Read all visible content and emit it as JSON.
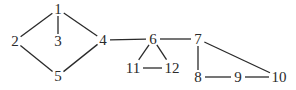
{
  "diagram": {
    "type": "undirected-graph",
    "nodes": [
      {
        "id": "1",
        "label": "1",
        "x": 58,
        "y": 9
      },
      {
        "id": "2",
        "label": "2",
        "x": 15,
        "y": 41
      },
      {
        "id": "3",
        "label": "3",
        "x": 58,
        "y": 41
      },
      {
        "id": "4",
        "label": "4",
        "x": 103,
        "y": 40
      },
      {
        "id": "5",
        "label": "5",
        "x": 58,
        "y": 76
      },
      {
        "id": "6",
        "label": "6",
        "x": 153,
        "y": 39
      },
      {
        "id": "7",
        "label": "7",
        "x": 198,
        "y": 39
      },
      {
        "id": "8",
        "label": "8",
        "x": 198,
        "y": 77
      },
      {
        "id": "9",
        "label": "9",
        "x": 238,
        "y": 77
      },
      {
        "id": "10",
        "label": "10",
        "x": 279,
        "y": 77
      },
      {
        "id": "11",
        "label": "11",
        "x": 133,
        "y": 68
      },
      {
        "id": "12",
        "label": "12",
        "x": 172,
        "y": 68
      }
    ],
    "edges": [
      {
        "from": "1",
        "to": "2"
      },
      {
        "from": "1",
        "to": "3"
      },
      {
        "from": "1",
        "to": "4"
      },
      {
        "from": "2",
        "to": "5"
      },
      {
        "from": "5",
        "to": "4"
      },
      {
        "from": "4",
        "to": "6"
      },
      {
        "from": "6",
        "to": "7"
      },
      {
        "from": "6",
        "to": "11"
      },
      {
        "from": "6",
        "to": "12"
      },
      {
        "from": "11",
        "to": "12"
      },
      {
        "from": "7",
        "to": "8"
      },
      {
        "from": "7",
        "to": "10"
      },
      {
        "from": "8",
        "to": "9"
      },
      {
        "from": "9",
        "to": "10"
      }
    ],
    "colors": {
      "stroke": "#2a2a2a",
      "background": "#ffffff"
    }
  }
}
